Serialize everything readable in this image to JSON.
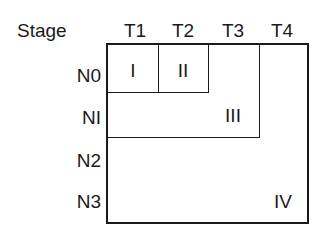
{
  "diagram": {
    "corner_label": "Stage",
    "columns": [
      "T1",
      "T2",
      "T3",
      "T4"
    ],
    "rows": [
      "N0",
      "NI",
      "N2",
      "N3"
    ],
    "regions": [
      {
        "label": "I",
        "cells": "T1 x N0"
      },
      {
        "label": "II",
        "cells": "T2 x N0"
      },
      {
        "label": "III",
        "cells": "T1-T3 x N0-NI (excluding I, II)"
      },
      {
        "label": "IV",
        "cells": "remaining T4 / N2-N3"
      }
    ],
    "line_color": "#1a1a1a",
    "background": "#ffffff"
  }
}
